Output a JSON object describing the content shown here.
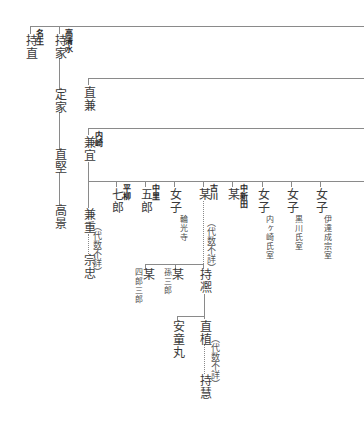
{
  "diagram": {
    "type": "genealogy",
    "lines_color": "#8a8a8a",
    "text_color": "#3b3b3b",
    "generation1": [
      {
        "clan": "名生",
        "name": "持直"
      },
      {
        "clan": "高清水",
        "name": "持家"
      }
    ],
    "takashimizu_line": [
      "定家",
      "直堅",
      "高景"
    ],
    "branch_naokane": {
      "name": "直兼"
    },
    "branch_kanenori": {
      "clan": "内崎",
      "name": "兼宜"
    },
    "kanenori_line": {
      "son": "兼重",
      "gap_note": "（代数不詳）",
      "descendant": "宗忠"
    },
    "children_row": [
      {
        "clan": "平柳",
        "name": "七郎"
      },
      {
        "clan": "中里",
        "name": "五郎"
      },
      {
        "name": "女子",
        "note": "輪光寺"
      },
      {
        "clan": "古川",
        "name": "某",
        "gap_note": "（代数不詳）"
      },
      {
        "clan": "中新田",
        "name": "某"
      },
      {
        "name": "女子",
        "note": "内ヶ崎氏室"
      },
      {
        "name": "女子",
        "note": "黒川氏室"
      },
      {
        "name": "女子",
        "note": "伊達成宗室"
      }
    ],
    "furukawa_children": [
      {
        "name": "某",
        "note": "四郎三郎"
      },
      {
        "name": "某",
        "note": "孫三郎"
      },
      {
        "name": "持凞"
      }
    ],
    "mochihiro_children": [
      {
        "name": "安童丸"
      },
      {
        "name": "直植",
        "gap_note": "（代数不詳）",
        "descendant": "持慧"
      }
    ]
  }
}
